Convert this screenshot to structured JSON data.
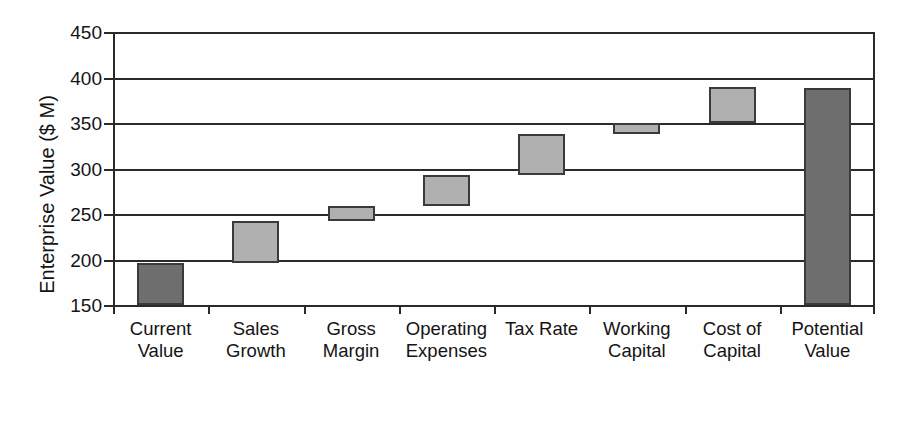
{
  "chart_data": {
    "type": "bar",
    "chart_subtype": "waterfall",
    "title": "",
    "xlabel": "",
    "ylabel": "Enterprise Value ($ M)",
    "ylim": [
      150,
      450
    ],
    "ytick_labels": [
      "450",
      "400",
      "350",
      "300",
      "250",
      "200",
      "150"
    ],
    "ytick_values": [
      450,
      400,
      350,
      300,
      250,
      200,
      150
    ],
    "ytick_step": 50,
    "grid": true,
    "legend": false,
    "categories": [
      "Current Value",
      "Sales Growth",
      "Gross Margin",
      "Operating Expenses",
      "Tax Rate",
      "Working Capital",
      "Cost of Capital",
      "Potential Value"
    ],
    "category_lines": [
      [
        "Current",
        "Value"
      ],
      [
        "Sales",
        "Growth"
      ],
      [
        "Gross",
        "Margin"
      ],
      [
        "Operating",
        "Expenses"
      ],
      [
        "Tax Rate",
        ""
      ],
      [
        "Working",
        "Capital"
      ],
      [
        "Cost of",
        "Capital"
      ],
      [
        "Potential",
        "Value"
      ]
    ],
    "bars": [
      {
        "label": "Current Value",
        "base": 150,
        "top": 196,
        "delta": 46,
        "kind": "total",
        "color": "#6e6e6e"
      },
      {
        "label": "Sales Growth",
        "base": 196,
        "top": 242,
        "delta": 46,
        "kind": "increment",
        "color": "#b0b0b0"
      },
      {
        "label": "Gross Margin",
        "base": 242,
        "top": 259,
        "delta": 17,
        "kind": "increment",
        "color": "#b0b0b0"
      },
      {
        "label": "Operating Expenses",
        "base": 259,
        "top": 293,
        "delta": 34,
        "kind": "increment",
        "color": "#b0b0b0"
      },
      {
        "label": "Tax Rate",
        "base": 293,
        "top": 338,
        "delta": 45,
        "kind": "increment",
        "color": "#b0b0b0"
      },
      {
        "label": "Working Capital",
        "base": 338,
        "top": 350,
        "delta": 12,
        "kind": "increment",
        "color": "#b0b0b0"
      },
      {
        "label": "Cost of Capital",
        "base": 350,
        "top": 390,
        "delta": 40,
        "kind": "increment",
        "color": "#b0b0b0"
      },
      {
        "label": "Potential Value",
        "base": 150,
        "top": 389,
        "delta": 239,
        "kind": "total",
        "color": "#6e6e6e"
      }
    ],
    "colors": {
      "total_bar": "#6e6e6e",
      "increment_bar": "#b0b0b0",
      "bar_outline": "#3a3a3a",
      "axis": "#2a2a2a",
      "text": "#141414",
      "background": "#fefefe"
    }
  }
}
